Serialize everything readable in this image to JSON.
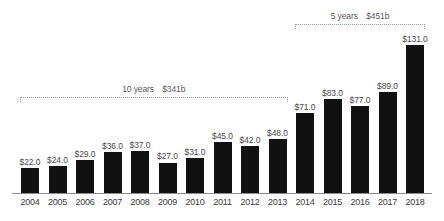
{
  "chart_data": {
    "type": "bar",
    "title": "",
    "subtitle": "",
    "xlabel": "",
    "ylabel": "",
    "grid": false,
    "legend": "none",
    "ylim": [
      0,
      131
    ],
    "categories": [
      "2004",
      "2005",
      "2006",
      "2007",
      "2008",
      "2009",
      "2010",
      "2011",
      "2012",
      "2013",
      "2014",
      "2015",
      "2016",
      "2017",
      "2018"
    ],
    "values": [
      22,
      24,
      29,
      36,
      37,
      27,
      31,
      45,
      42,
      48,
      71,
      83,
      77,
      89,
      131
    ],
    "value_labels": [
      "$22.0",
      "$24.0",
      "$29.0",
      "$36.0",
      "$37.0",
      "$27.0",
      "$31.0",
      "$45.0",
      "$42.0",
      "$48.0",
      "$71.0",
      "$83.0",
      "$77.0",
      "$89.0",
      "$131.0"
    ],
    "bar_color": "#111111",
    "value_label_color": "#4a4a4a",
    "axis_color": "#8c8c8c",
    "annotations": [
      {
        "id": "ten-years",
        "years_label": "10 years",
        "total_label": "$341b",
        "span_start_category": "2004",
        "span_end_category": "2013"
      },
      {
        "id": "five-years",
        "years_label": "5 years",
        "total_label": "$451b",
        "span_start_category": "2014",
        "span_end_category": "2018"
      }
    ]
  }
}
